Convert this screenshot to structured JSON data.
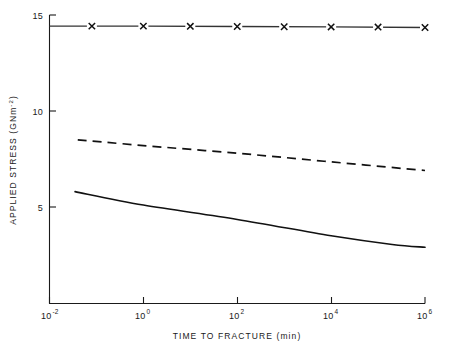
{
  "chart_data": {
    "type": "line",
    "title": "",
    "xlabel": "TIME TO FRACTURE (min)",
    "ylabel": "APPLIED STRESS (GNm-2)",
    "ylabel_base": "APPLIED STRESS (GNm",
    "ylabel_exp": "-2",
    "ylabel_tail": ")",
    "xscale": "log",
    "yscale": "linear",
    "xlim": [
      0.01,
      1000000
    ],
    "ylim": [
      0,
      15
    ],
    "grid": false,
    "legend": "none",
    "xticks": [
      {
        "value": 0.01,
        "base": "10",
        "exp": "-2",
        "label": "10^-2"
      },
      {
        "value": 1,
        "base": "10",
        "exp": "0",
        "label": "10^0"
      },
      {
        "value": 100,
        "base": "10",
        "exp": "2",
        "label": "10^2"
      },
      {
        "value": 10000,
        "base": "10",
        "exp": "4",
        "label": "10^4"
      },
      {
        "value": 1000000,
        "base": "10",
        "exp": "6",
        "label": "10^6"
      }
    ],
    "yticks": [
      {
        "value": 5,
        "label": "5"
      },
      {
        "value": 10,
        "label": "10"
      },
      {
        "value": 15,
        "label": "15"
      }
    ],
    "series": [
      {
        "name": "marked-line-x",
        "style": "solid-with-x-markers",
        "color": "#333333",
        "x": [
          0.01,
          1,
          100,
          10000,
          1000000
        ],
        "y": [
          14.42,
          14.42,
          14.4,
          14.38,
          14.35
        ],
        "markers": {
          "symbol": "x",
          "x": [
            0.08,
            1.0,
            10.0,
            100.0,
            1000.0,
            10000.0,
            100000.0,
            1000000.0
          ],
          "y": [
            14.42,
            14.42,
            14.41,
            14.4,
            14.39,
            14.38,
            14.37,
            14.35
          ]
        }
      },
      {
        "name": "dashed-line",
        "style": "dashed",
        "color": "#111111",
        "x": [
          0.04,
          1,
          100,
          10000,
          1000000
        ],
        "y": [
          8.5,
          8.2,
          7.8,
          7.35,
          6.9
        ]
      },
      {
        "name": "solid-curve",
        "style": "solid",
        "color": "#111111",
        "x": [
          0.035,
          1,
          100,
          10000,
          200000,
          1000000
        ],
        "y": [
          5.8,
          5.1,
          4.35,
          3.5,
          3.05,
          2.9
        ]
      }
    ]
  }
}
